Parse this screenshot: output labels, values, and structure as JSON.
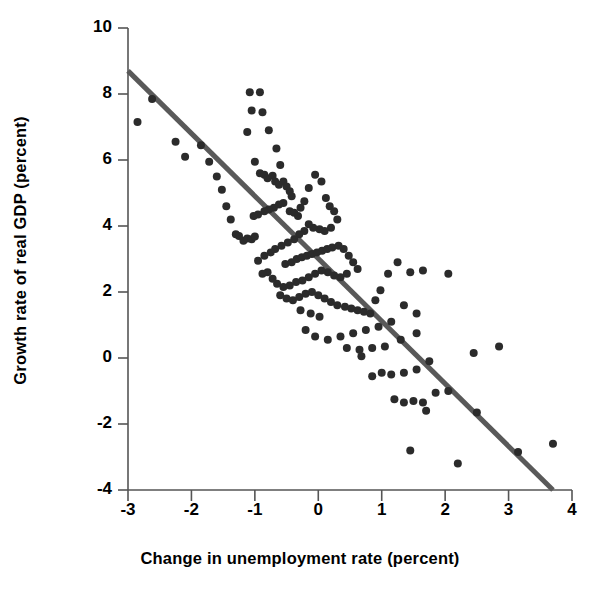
{
  "chart_data": {
    "type": "scatter",
    "title": "",
    "xlabel": "Change in unemployment rate (percent)",
    "ylabel": "Growth rate of real GDP (percent)",
    "xlim": [
      -3,
      4
    ],
    "ylim": [
      -4,
      10
    ],
    "xticks": [
      -3,
      -2,
      -1,
      0,
      1,
      2,
      3,
      4
    ],
    "xtick_labels": [
      "-3",
      "-2",
      "-1",
      "0",
      "1",
      "2",
      "3",
      "4"
    ],
    "yticks": [
      -4,
      -2,
      0,
      2,
      4,
      6,
      8,
      10
    ],
    "ytick_labels": [
      "-4",
      "-2",
      "0",
      "2",
      "4",
      "6",
      "8",
      "10"
    ],
    "grid": false,
    "legend": null,
    "marker_color": "#2b2b2b",
    "marker_size": 7,
    "trendline": {
      "label": "",
      "color": "#595959",
      "width": 5,
      "x": [
        -3,
        3.7
      ],
      "y": [
        8.7,
        -4.0
      ],
      "slope": -1.896,
      "intercept": 3.01
    },
    "series": [
      {
        "name": "Okun's law observations",
        "points": [
          [
            -2.85,
            7.15
          ],
          [
            -2.62,
            7.85
          ],
          [
            -2.25,
            6.55
          ],
          [
            -2.1,
            6.1
          ],
          [
            -1.85,
            6.45
          ],
          [
            -1.72,
            5.95
          ],
          [
            -1.6,
            5.5
          ],
          [
            -1.52,
            5.1
          ],
          [
            -1.45,
            4.6
          ],
          [
            -1.38,
            4.2
          ],
          [
            -1.3,
            3.75
          ],
          [
            -1.25,
            3.7
          ],
          [
            -1.18,
            3.55
          ],
          [
            -1.12,
            3.62
          ],
          [
            -1.05,
            3.6
          ],
          [
            -1.0,
            3.68
          ],
          [
            -1.08,
            8.05
          ],
          [
            -0.92,
            8.05
          ],
          [
            -1.05,
            7.5
          ],
          [
            -0.88,
            7.45
          ],
          [
            -1.12,
            6.85
          ],
          [
            -0.78,
            6.9
          ],
          [
            -0.66,
            6.35
          ],
          [
            -0.6,
            5.85
          ],
          [
            -1.0,
            5.95
          ],
          [
            -0.92,
            5.6
          ],
          [
            -0.85,
            5.55
          ],
          [
            -0.8,
            5.45
          ],
          [
            -0.72,
            5.52
          ],
          [
            -0.68,
            5.35
          ],
          [
            -0.62,
            5.25
          ],
          [
            -0.55,
            5.35
          ],
          [
            -0.5,
            5.2
          ],
          [
            -0.45,
            5.05
          ],
          [
            -0.42,
            4.9
          ],
          [
            -0.55,
            4.7
          ],
          [
            -0.62,
            4.65
          ],
          [
            -0.7,
            4.55
          ],
          [
            -0.78,
            4.5
          ],
          [
            -0.85,
            4.45
          ],
          [
            -0.95,
            4.35
          ],
          [
            -1.02,
            4.3
          ],
          [
            -0.45,
            4.45
          ],
          [
            -0.38,
            4.4
          ],
          [
            -0.32,
            4.3
          ],
          [
            -0.28,
            4.55
          ],
          [
            -0.22,
            4.75
          ],
          [
            -0.15,
            5.15
          ],
          [
            -0.05,
            5.55
          ],
          [
            0.05,
            5.35
          ],
          [
            0.12,
            4.85
          ],
          [
            0.18,
            4.6
          ],
          [
            0.25,
            4.45
          ],
          [
            0.3,
            4.2
          ],
          [
            0.2,
            3.95
          ],
          [
            0.1,
            3.85
          ],
          [
            0.02,
            3.9
          ],
          [
            -0.08,
            3.95
          ],
          [
            -0.15,
            4.05
          ],
          [
            -0.22,
            3.85
          ],
          [
            -0.3,
            3.75
          ],
          [
            -0.38,
            3.6
          ],
          [
            -0.48,
            3.5
          ],
          [
            -0.58,
            3.4
          ],
          [
            -0.68,
            3.3
          ],
          [
            -0.75,
            3.2
          ],
          [
            -0.85,
            3.1
          ],
          [
            -0.95,
            2.95
          ],
          [
            -0.52,
            2.85
          ],
          [
            -0.42,
            2.9
          ],
          [
            -0.34,
            3.0
          ],
          [
            -0.26,
            3.05
          ],
          [
            -0.18,
            3.1
          ],
          [
            -0.1,
            3.15
          ],
          [
            -0.02,
            3.2
          ],
          [
            0.06,
            3.25
          ],
          [
            0.14,
            3.3
          ],
          [
            0.22,
            3.35
          ],
          [
            0.32,
            3.4
          ],
          [
            0.4,
            3.3
          ],
          [
            0.48,
            3.1
          ],
          [
            0.55,
            2.9
          ],
          [
            0.62,
            2.7
          ],
          [
            0.45,
            2.55
          ],
          [
            0.35,
            2.45
          ],
          [
            0.25,
            2.5
          ],
          [
            0.15,
            2.6
          ],
          [
            0.05,
            2.65
          ],
          [
            -0.05,
            2.55
          ],
          [
            -0.15,
            2.45
          ],
          [
            -0.25,
            2.35
          ],
          [
            -0.35,
            2.3
          ],
          [
            -0.45,
            2.2
          ],
          [
            -0.55,
            2.15
          ],
          [
            -0.65,
            2.25
          ],
          [
            -0.72,
            2.4
          ],
          [
            -0.8,
            2.6
          ],
          [
            -0.88,
            2.55
          ],
          [
            -0.6,
            1.9
          ],
          [
            -0.5,
            1.8
          ],
          [
            -0.4,
            1.75
          ],
          [
            -0.3,
            1.85
          ],
          [
            -0.2,
            1.95
          ],
          [
            -0.1,
            2.0
          ],
          [
            0.0,
            1.9
          ],
          [
            0.1,
            1.8
          ],
          [
            0.2,
            1.7
          ],
          [
            0.3,
            1.6
          ],
          [
            0.42,
            1.55
          ],
          [
            0.52,
            1.5
          ],
          [
            0.62,
            1.45
          ],
          [
            0.72,
            1.4
          ],
          [
            0.82,
            1.35
          ],
          [
            0.9,
            1.75
          ],
          [
            0.98,
            2.05
          ],
          [
            1.1,
            2.55
          ],
          [
            1.25,
            2.9
          ],
          [
            1.45,
            2.6
          ],
          [
            1.65,
            2.65
          ],
          [
            2.05,
            2.55
          ],
          [
            1.35,
            1.6
          ],
          [
            1.55,
            1.35
          ],
          [
            1.15,
            1.1
          ],
          [
            0.95,
            0.95
          ],
          [
            0.75,
            0.85
          ],
          [
            0.55,
            0.75
          ],
          [
            0.35,
            0.65
          ],
          [
            0.15,
            0.55
          ],
          [
            -0.05,
            0.65
          ],
          [
            -0.2,
            0.85
          ],
          [
            0.45,
            0.3
          ],
          [
            0.65,
            0.25
          ],
          [
            0.85,
            0.3
          ],
          [
            1.05,
            0.35
          ],
          [
            1.3,
            0.55
          ],
          [
            1.55,
            0.75
          ],
          [
            1.75,
            -0.1
          ],
          [
            1.55,
            -0.35
          ],
          [
            1.35,
            -0.45
          ],
          [
            1.15,
            -0.5
          ],
          [
            1.0,
            -0.45
          ],
          [
            0.85,
            -0.55
          ],
          [
            1.2,
            -1.25
          ],
          [
            1.35,
            -1.35
          ],
          [
            1.5,
            -1.3
          ],
          [
            1.65,
            -1.35
          ],
          [
            1.7,
            -1.6
          ],
          [
            1.85,
            -1.05
          ],
          [
            2.05,
            -1.0
          ],
          [
            2.5,
            -1.65
          ],
          [
            2.85,
            0.35
          ],
          [
            3.15,
            -2.85
          ],
          [
            3.7,
            -2.6
          ],
          [
            2.45,
            0.15
          ],
          [
            1.45,
            -2.8
          ],
          [
            2.2,
            -3.2
          ],
          [
            0.68,
            0.05
          ],
          [
            -0.12,
            1.35
          ],
          [
            -0.28,
            1.45
          ],
          [
            0.02,
            1.25
          ]
        ]
      }
    ]
  },
  "axes": {
    "x_domain_min": -3,
    "x_domain_max": 4,
    "y_domain_min": -4,
    "y_domain_max": 10
  }
}
